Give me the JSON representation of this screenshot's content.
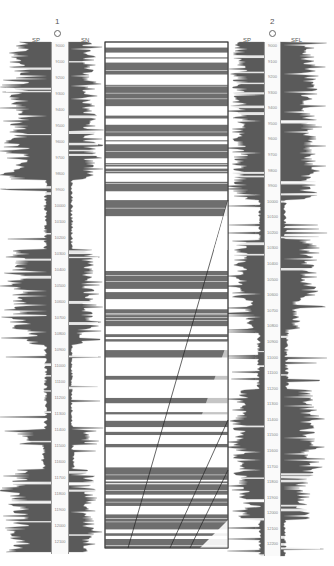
{
  "wells": [
    {
      "id": "1",
      "title": "1",
      "left_curve": "SP",
      "right_curve": "SN",
      "depth_labels": [
        "9000",
        "9100",
        "9200",
        "9300",
        "9400",
        "9500",
        "9600",
        "9700",
        "9800",
        "9900",
        "10000",
        "10100",
        "10200",
        "10300",
        "10400",
        "10500",
        "10600",
        "10700",
        "10800",
        "10900",
        "11000",
        "11100",
        "11200",
        "11300",
        "11400",
        "11500",
        "11600",
        "11700",
        "11800",
        "11900",
        "12000",
        "12100"
      ]
    },
    {
      "id": "2",
      "title": "2",
      "left_curve": "SP",
      "right_curve": "SFL",
      "depth_labels": [
        "9000",
        "9100",
        "9200",
        "9300",
        "9400",
        "9500",
        "9600",
        "9700",
        "9800",
        "9900",
        "10000",
        "10100",
        "10200",
        "10300",
        "10400",
        "10500",
        "10600",
        "10700",
        "10800",
        "10900",
        "11000",
        "11100",
        "11200",
        "11300",
        "11400",
        "11500",
        "11600",
        "11700",
        "11800",
        "11900",
        "12000",
        "12100",
        "12200"
      ]
    }
  ],
  "correlation_panel": {
    "description": "Lithology correlation between well 1 and well 2 with dipping fault lines",
    "fill_color": "#6e6e6e",
    "faults": [
      {
        "x1": 228,
        "y1": 200,
        "x2": 128,
        "y2": 548
      },
      {
        "x1": 228,
        "y1": 420,
        "x2": 170,
        "y2": 548
      },
      {
        "x1": 228,
        "y1": 470,
        "x2": 190,
        "y2": 548
      }
    ]
  },
  "colors": {
    "log_fill": "#5a5a5a",
    "log_line": "#777777",
    "panel_border": "#333333",
    "sand_white": "#ffffff"
  }
}
